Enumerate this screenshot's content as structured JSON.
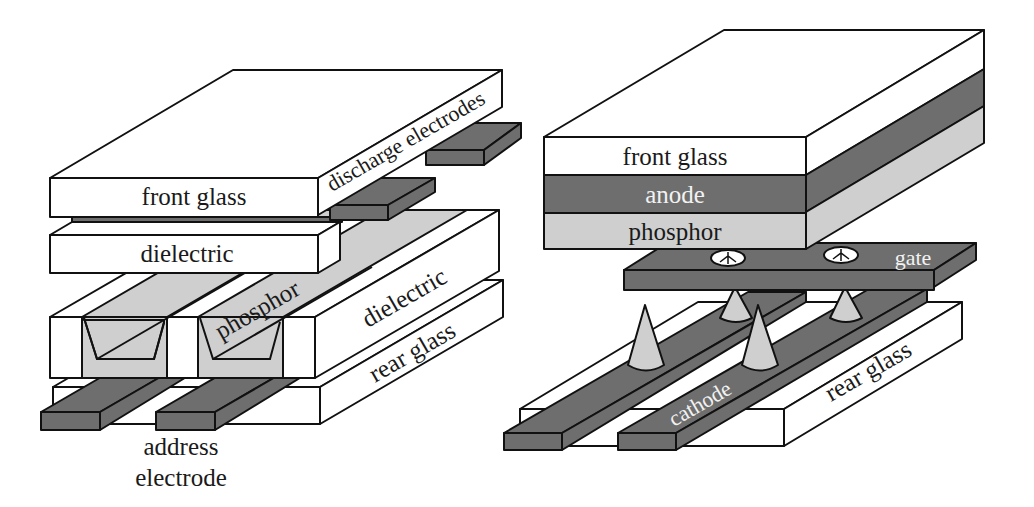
{
  "colors": {
    "white_layer": "#ffffff",
    "dark_layer": "#6e6e6e",
    "light_layer": "#cfcfcf",
    "outline": "#111111"
  },
  "pdp": {
    "front_glass": "front glass",
    "discharge_electrodes": "discharge electrodes",
    "dielectric_top": "dielectric",
    "phosphor": "phosphor",
    "dielectric_side": "dielectric",
    "rear_glass": "rear glass",
    "address_electrode_line1": "address",
    "address_electrode_line2": "electrode"
  },
  "fed": {
    "front_glass": "front glass",
    "anode": "anode",
    "phosphor": "phosphor",
    "gate": "gate",
    "cathode": "cathode",
    "rear_glass": "rear glass"
  }
}
